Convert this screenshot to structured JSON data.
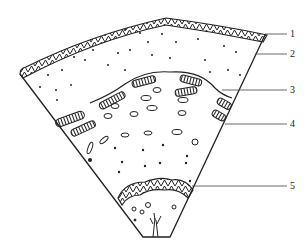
{
  "diagram": {
    "type": "sector cross-section",
    "labels": [
      {
        "id": 1,
        "text": "1",
        "x": 290,
        "y": 29
      },
      {
        "id": 2,
        "text": "2",
        "x": 290,
        "y": 49
      },
      {
        "id": 3,
        "text": "3",
        "x": 290,
        "y": 86
      },
      {
        "id": 4,
        "text": "4",
        "x": 290,
        "y": 120
      },
      {
        "id": 5,
        "text": "5",
        "x": 290,
        "y": 182
      }
    ],
    "colors": {
      "ink": "#222222",
      "paper": "#ffffff"
    }
  }
}
